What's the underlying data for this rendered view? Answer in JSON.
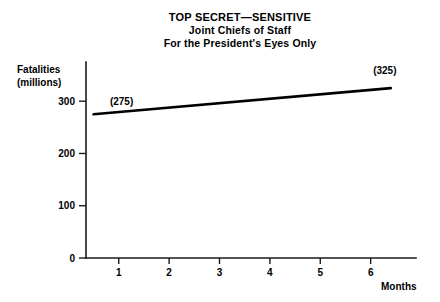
{
  "chart_data": {
    "type": "line",
    "title": "TOP SECRET—SENSITIVE",
    "subtitle": "Joint Chiefs of Staff",
    "subtitle2": "For the President's Eyes Only",
    "xlabel": "Months",
    "ylabel": "Fatalities",
    "ylabel2": "(millions)",
    "x": [
      0.5,
      6.4
    ],
    "values": [
      275,
      325
    ],
    "series": [
      {
        "name": "Fatalities",
        "x": [
          0.5,
          6.4
        ],
        "values": [
          275,
          325
        ]
      }
    ],
    "point_labels": [
      "(275)",
      "(325)"
    ],
    "xticks": [
      1,
      2,
      3,
      4,
      5,
      6
    ],
    "xtick_labels": [
      "1",
      "2",
      "3",
      "4",
      "5",
      "6"
    ],
    "yticks": [
      0,
      100,
      200,
      300
    ],
    "ytick_labels": [
      "0",
      "100",
      "200",
      "300"
    ],
    "xlim": [
      0.35,
      6.9
    ],
    "ylim": [
      0,
      375
    ],
    "grid": false,
    "legend": false,
    "line_color": "#000000",
    "axis_color": "#1a1a1a",
    "background_color": "#ffffff"
  }
}
